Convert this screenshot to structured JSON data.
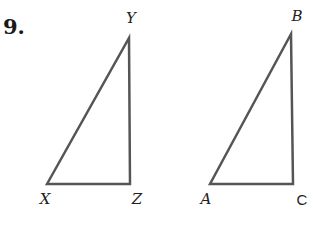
{
  "problem": {
    "number": "9."
  },
  "style": {
    "line_color": "#555555",
    "line_width": 2.5,
    "text_color": "#222222"
  },
  "triangles": [
    {
      "name": "triangle-XYZ",
      "vertices": [
        {
          "label": "X",
          "x": 47,
          "y": 184,
          "label_x": 45,
          "label_y": 199
        },
        {
          "label": "Y",
          "x": 129,
          "y": 38,
          "label_x": 131,
          "label_y": 18
        },
        {
          "label": "Z",
          "x": 130,
          "y": 184,
          "label_x": 137,
          "label_y": 199
        }
      ]
    },
    {
      "name": "triangle-ABC",
      "vertices": [
        {
          "label": "A",
          "x": 210,
          "y": 184,
          "label_x": 206,
          "label_y": 199
        },
        {
          "label": "B",
          "x": 291,
          "y": 34,
          "label_x": 297,
          "label_y": 16
        },
        {
          "label": "C",
          "x": 293,
          "y": 184,
          "label_x": 302,
          "label_y": 199
        }
      ]
    }
  ]
}
